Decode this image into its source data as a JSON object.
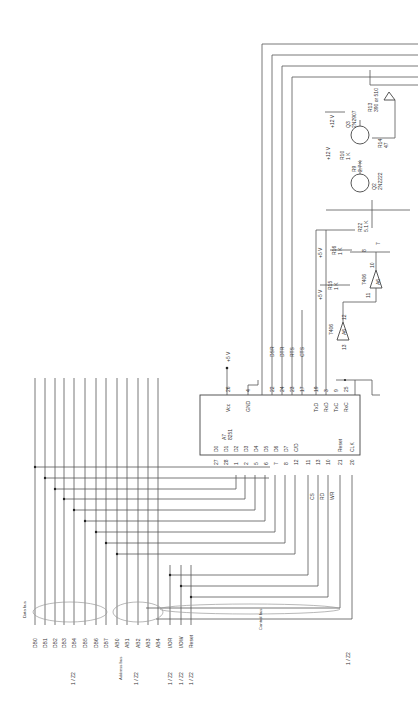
{
  "diagram": {
    "orientation": "rotated 90 degrees counter-clockwise",
    "chip": {
      "ref": "A7",
      "part": "8251",
      "power_pin": {
        "num": "26",
        "label": "Vcc",
        "supply": "+5 V"
      },
      "ground_pin": {
        "num": "4",
        "label": "GND"
      },
      "data_pins": [
        {
          "num": "27",
          "label": "D0"
        },
        {
          "num": "28",
          "label": "D1"
        },
        {
          "num": "1",
          "label": "D2"
        },
        {
          "num": "2",
          "label": "D3"
        },
        {
          "num": "5",
          "label": "D4"
        },
        {
          "num": "6",
          "label": "D5"
        },
        {
          "num": "7",
          "label": "D6"
        },
        {
          "num": "8",
          "label": "D7"
        }
      ],
      "control_pins": [
        {
          "num": "12",
          "label": "C/D"
        },
        {
          "num": "11",
          "label": "CS"
        },
        {
          "num": "13",
          "label": "RD"
        },
        {
          "num": "10",
          "label": "WR"
        },
        {
          "num": "21",
          "label": "Reset"
        },
        {
          "num": "20",
          "label": "CLK"
        }
      ],
      "modem_pins": [
        {
          "num": "22",
          "label": "DSR"
        },
        {
          "num": "24",
          "label": "DTR"
        },
        {
          "num": "23",
          "label": "RTS"
        },
        {
          "num": "17",
          "label": "CTS"
        }
      ],
      "serial_pins": [
        {
          "num": "19",
          "label": "TxD"
        },
        {
          "num": "3",
          "label": "RxD"
        },
        {
          "num": "9",
          "label": "TxC"
        },
        {
          "num": "25",
          "label": "RxC"
        }
      ],
      "control_labels": [
        "CS",
        "RD",
        "WR"
      ]
    },
    "buses": {
      "data_bus": {
        "label": "Data bus",
        "lines": [
          "DB0",
          "DB1",
          "DB2",
          "DB3",
          "DB4",
          "DB5",
          "DB6",
          "DB7"
        ],
        "ref": "1 / Z2"
      },
      "address_bus": {
        "label": "Address bus",
        "lines": [
          "AB0",
          "AB1",
          "AB2",
          "AB3",
          "AB4"
        ],
        "ref": "1 / Z2"
      },
      "control_bus": {
        "label": "Control bus",
        "lines": [
          "I/OR",
          "I/OW",
          "Reset"
        ],
        "refs": [
          "1 / Z2",
          "1 / Z2",
          "1 / Z2"
        ]
      },
      "clock_ref": "1 / Z2"
    },
    "line_driver": {
      "gates": [
        {
          "ref": "A6",
          "part": "7406",
          "in_pin": "13",
          "out_pin": "12"
        },
        {
          "ref": "A6",
          "part": "7406",
          "in_pin": "11",
          "out_pin": "10"
        }
      ],
      "resistors": [
        {
          "ref": "R15",
          "value": "1 K",
          "supply": "+5 V"
        },
        {
          "ref": "R16",
          "value": "1 K",
          "supply": "+5 V"
        },
        {
          "ref": "R22",
          "value": "5.1 K"
        },
        {
          "ref": "R9",
          "value": "2.7 K"
        },
        {
          "ref": "R10",
          "value": "1 K",
          "supply": "+12 V"
        },
        {
          "ref": "R13",
          "value": "390 or 510"
        },
        {
          "ref": "R14",
          "value": "47"
        }
      ],
      "transistors": [
        {
          "ref": "Q3",
          "part": "2N2907",
          "supply": "+12 V"
        },
        {
          "ref": "Q2",
          "part": "2N2222"
        }
      ],
      "connector_pins": [
        "8",
        "7"
      ]
    }
  }
}
